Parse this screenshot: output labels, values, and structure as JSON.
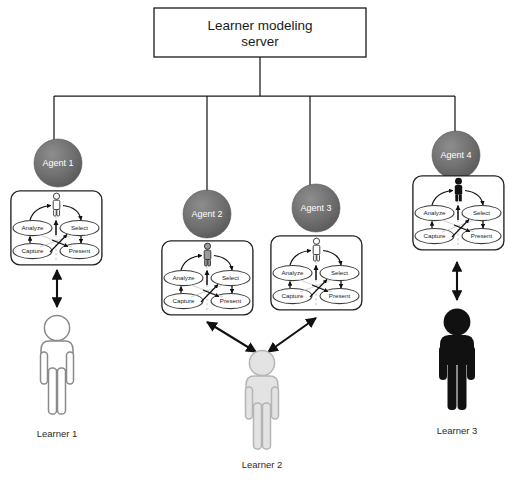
{
  "diagram": {
    "title_box": {
      "line1": "Learner  modeling",
      "line2": "server"
    },
    "agents": [
      {
        "id": "agent-1",
        "label": "Agent 1",
        "figure_fill": "#ffffff",
        "cx": 58,
        "cy": 163,
        "r": 24,
        "box_x": 10,
        "box_y": 190,
        "box_w": 93,
        "box_h": 76,
        "trunk_x": 54
      },
      {
        "id": "agent-2",
        "label": "Agent 2",
        "figure_fill": "#9a9a9a",
        "cx": 207,
        "cy": 214,
        "r": 24,
        "box_x": 161,
        "box_y": 240,
        "box_w": 92,
        "box_h": 78,
        "trunk_x": 207
      },
      {
        "id": "agent-3",
        "label": "Agent 3",
        "figure_fill": "#ffffff",
        "cx": 316,
        "cy": 208,
        "r": 24,
        "box_x": 270,
        "box_y": 235,
        "box_w": 92,
        "box_h": 78,
        "trunk_x": 310
      },
      {
        "id": "agent-4",
        "label": "Agent 4",
        "figure_fill": "#111111",
        "cx": 456,
        "cy": 155,
        "r": 24,
        "box_x": 412,
        "box_y": 175,
        "box_w": 88,
        "box_h": 76,
        "trunk_x": 455
      }
    ],
    "process_ovals": {
      "analyze": "Analyze",
      "capture": "Capture",
      "select": "Select",
      "present": "Present"
    },
    "learners": [
      {
        "id": "learner-1",
        "label": "Learner 1",
        "fill": "#ffffff",
        "stroke": "#8a8a8a",
        "x": 65,
        "y": 315,
        "scale": 1.0,
        "label_x": 51,
        "label_y": 437
      },
      {
        "id": "learner-2",
        "label": "Learner 2",
        "fill": "#e3e3e3",
        "stroke": "#b5b5b5",
        "x": 261,
        "y": 357,
        "scale": 1.0,
        "label_x": 247,
        "label_y": 468
      },
      {
        "id": "learner-3",
        "label": "Learner 3",
        "fill": "#111111",
        "stroke": "#111111",
        "x": 457,
        "y": 312,
        "scale": 1.0,
        "label_x": 443,
        "label_y": 434
      }
    ],
    "colors": {
      "agent_sphere": "#6e6e6e",
      "agent_sphere_edge": "#4f4f4f",
      "line": "#1a1a1a",
      "oval_stroke": "#3a3a3a",
      "dashed": "#b9b9b9"
    },
    "bus": {
      "y": 96,
      "x_left": 54,
      "x_right": 455,
      "stem_x": 260,
      "stem_top": 57
    },
    "server_box": {
      "x": 154,
      "y": 8,
      "w": 212,
      "h": 49
    }
  }
}
